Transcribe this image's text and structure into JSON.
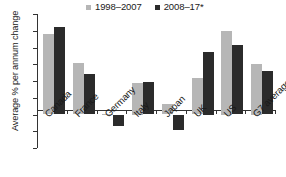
{
  "chart_data": {
    "type": "bar",
    "title": "",
    "xlabel": "",
    "ylabel": "Average % per annum change",
    "categories": [
      "Canada",
      "France",
      "Germany",
      "Italy",
      "Japan",
      "UK",
      "US",
      "G7 average"
    ],
    "series": [
      {
        "name": "1998–2007",
        "color": "#b6b6b6",
        "values": [
          0.96,
          0.61,
          0.01,
          0.375,
          0.13,
          0.43,
          1.0,
          0.6
        ]
      },
      {
        "name": "2008–17*",
        "color": "#2b2b2b",
        "values": [
          1.04,
          0.48,
          -0.14,
          0.385,
          -0.18,
          0.75,
          0.83,
          0.52
        ]
      }
    ],
    "ylim": [
      -0.4,
      1.2
    ],
    "yticks": [
      "1.2",
      "1.0",
      "0.8",
      "0.6",
      "0.4",
      "0.2",
      "0",
      "–0.2",
      "–0.4"
    ],
    "ytick_values": [
      1.2,
      1.0,
      0.8,
      0.6,
      0.4,
      0.2,
      0,
      -0.2,
      -0.4
    ],
    "grid": false,
    "legend_position": "top-center"
  },
  "legend": {
    "items": [
      {
        "label": "1998–2007",
        "color": "#b6b6b6"
      },
      {
        "label": "2008–17*",
        "color": "#2b2b2b"
      }
    ]
  },
  "axes": {
    "y_title": "Average % per annum change"
  }
}
